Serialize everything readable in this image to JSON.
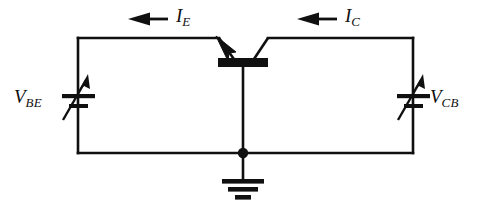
{
  "figure": {
    "background_color": "#ffffff",
    "line_color": "#101010"
  },
  "labels": {
    "emitter_current": {
      "symbol": "I",
      "subscript": "E"
    },
    "collector_current": {
      "symbol": "I",
      "subscript": "C"
    },
    "base_emitter_voltage": {
      "symbol": "V",
      "subscript": "BE"
    },
    "collector_base_voltage": {
      "symbol": "V",
      "subscript": "CB"
    }
  },
  "components": {
    "transistor": {
      "name": "bjt-transistor",
      "type": "npn-common-base"
    },
    "left_source": {
      "name": "variable-voltage-source-vbe",
      "type": "variable-dc-source"
    },
    "right_source": {
      "name": "variable-voltage-source-vcb",
      "type": "variable-dc-source"
    },
    "ground": {
      "name": "ground-symbol",
      "type": "earth-ground"
    },
    "junction": {
      "name": "junction-dot",
      "type": "node"
    }
  },
  "arrows": {
    "emitter_current_direction": "left",
    "collector_current_direction": "left"
  }
}
